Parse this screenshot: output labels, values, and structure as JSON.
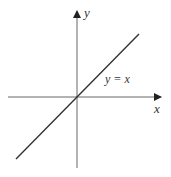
{
  "diagram": {
    "type": "coordinate-plot",
    "axes": {
      "x_label": "x",
      "y_label": "y"
    },
    "curve": {
      "label": "y = x",
      "equation": "y = x"
    },
    "colors": {
      "axis": "#555555",
      "line": "#333333",
      "text": "#333333"
    }
  }
}
